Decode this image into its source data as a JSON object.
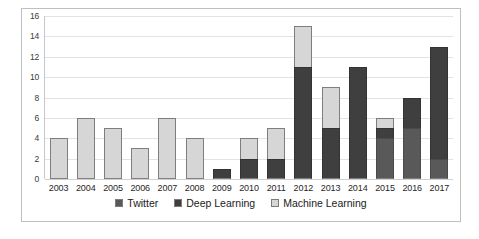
{
  "chart_data": {
    "type": "bar",
    "stacked": true,
    "title": "",
    "subtitle": "",
    "xlabel": "",
    "ylabel": "",
    "categories": [
      "2003",
      "2004",
      "2005",
      "2006",
      "2007",
      "2008",
      "2009",
      "2010",
      "2011",
      "2012",
      "2013",
      "2014",
      "2015",
      "2016",
      "2017"
    ],
    "series": [
      {
        "name": "Twitter",
        "color": "#595959",
        "values": [
          0,
          0,
          0,
          0,
          0,
          0,
          0,
          0,
          0,
          0,
          0,
          0,
          4,
          5,
          2
        ]
      },
      {
        "name": "Deep Learning",
        "color": "#3f3f3f",
        "values": [
          0,
          0,
          0,
          0,
          0,
          0,
          1,
          2,
          2,
          11,
          5,
          11,
          1,
          3,
          11
        ]
      },
      {
        "name": "Machine Learning",
        "color": "#d6d6d6",
        "values": [
          4,
          6,
          5,
          3,
          6,
          4,
          0,
          2,
          3,
          4,
          4,
          0,
          1,
          0,
          0
        ]
      }
    ],
    "totals": [
      4,
      6,
      5,
      3,
      6,
      4,
      1,
      4,
      5,
      15,
      9,
      11,
      6,
      8,
      13
    ],
    "ylim": [
      0,
      16
    ],
    "ytick_step": 2,
    "yticks": [
      0,
      2,
      4,
      6,
      8,
      10,
      12,
      14,
      16
    ],
    "ytick_labels": [
      "0",
      "2",
      "4",
      "6",
      "8",
      "10",
      "12",
      "14",
      "16"
    ],
    "grid": true,
    "grid_axis": "y",
    "legend_position": "bottom"
  },
  "legend": {
    "items": [
      {
        "label": "Twitter",
        "color": "#595959"
      },
      {
        "label": "Deep Learning",
        "color": "#3f3f3f"
      },
      {
        "label": "Machine Learning",
        "color": "#d6d6d6"
      }
    ]
  }
}
